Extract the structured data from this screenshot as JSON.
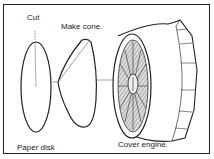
{
  "diagram": {
    "labels": {
      "cut": "Cut",
      "make_cone": "Make cone.",
      "paper_disk": "Paper disk",
      "cover_engine": "Cover engine."
    },
    "colors": {
      "line": "#222222",
      "background": "#ffffff"
    },
    "steps": [
      {
        "name": "paper-disk",
        "label": "Paper disk"
      },
      {
        "name": "cone",
        "label": "Make cone."
      },
      {
        "name": "engine",
        "label": "Cover engine."
      }
    ]
  }
}
